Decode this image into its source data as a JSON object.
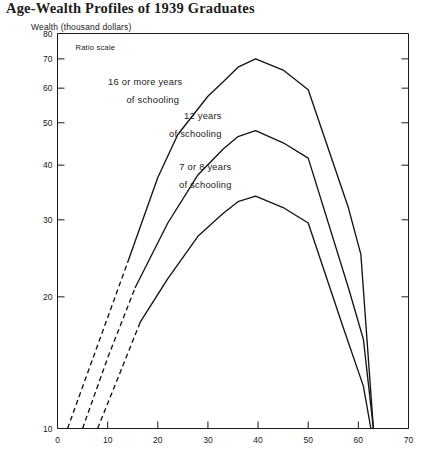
{
  "chart_title": "Age-Wealth Profiles of 1939 Graduates",
  "y_axis_caption": "Wealth (thousand dollars)",
  "scale_note": "Ratio scale",
  "chart_data": {
    "type": "line",
    "title": "Age-Wealth Profiles of 1939 Graduates",
    "subtitle": "",
    "xlabel": "",
    "ylabel": "Wealth (thousand dollars)",
    "scale_note": "Ratio scale",
    "yscale": "log",
    "xscale": "linear",
    "xlim": [
      0,
      70
    ],
    "ylim": [
      10,
      80
    ],
    "xticks": [
      0,
      10,
      20,
      30,
      40,
      50,
      60,
      70
    ],
    "yticks": [
      10,
      20,
      30,
      40,
      50,
      60,
      70,
      80
    ],
    "grid": false,
    "legend": "inline-annotations",
    "series": [
      {
        "name": "16 or more years of schooling",
        "label_line1": "16 or more years",
        "label_line2": "of schooling",
        "dashed_segment": [
          {
            "x": 2.0,
            "y": 10.0
          },
          {
            "x": 8.0,
            "y": 15.5
          },
          {
            "x": 14.0,
            "y": 24.0
          }
        ],
        "solid_segment": [
          {
            "x": 14.0,
            "y": 24.0
          },
          {
            "x": 20.0,
            "y": 37.5
          },
          {
            "x": 24.0,
            "y": 47.0
          },
          {
            "x": 30.0,
            "y": 57.5
          },
          {
            "x": 33.0,
            "y": 62.0
          },
          {
            "x": 36.0,
            "y": 67.0
          },
          {
            "x": 39.5,
            "y": 70.0
          },
          {
            "x": 45.0,
            "y": 66.0
          },
          {
            "x": 50.0,
            "y": 59.5
          },
          {
            "x": 58.0,
            "y": 32.0
          },
          {
            "x": 60.5,
            "y": 25.0
          },
          {
            "x": 63.0,
            "y": 10.0
          }
        ]
      },
      {
        "name": "12 years of schooling",
        "label_line1": "12 years",
        "label_line2": "of schooling",
        "dashed_segment": [
          {
            "x": 5.0,
            "y": 10.0
          },
          {
            "x": 10.0,
            "y": 14.5
          },
          {
            "x": 15.5,
            "y": 21.0
          }
        ],
        "solid_segment": [
          {
            "x": 15.5,
            "y": 21.0
          },
          {
            "x": 22.0,
            "y": 29.5
          },
          {
            "x": 28.0,
            "y": 38.0
          },
          {
            "x": 33.0,
            "y": 43.5
          },
          {
            "x": 36.0,
            "y": 46.5
          },
          {
            "x": 39.5,
            "y": 48.0
          },
          {
            "x": 45.0,
            "y": 45.0
          },
          {
            "x": 50.0,
            "y": 41.5
          },
          {
            "x": 58.0,
            "y": 21.0
          },
          {
            "x": 61.0,
            "y": 16.0
          },
          {
            "x": 63.0,
            "y": 10.0
          }
        ]
      },
      {
        "name": "7 or 8 years of schooling",
        "label_line1": "7 or 8 years",
        "label_line2": "of schooling",
        "dashed_segment": [
          {
            "x": 8.0,
            "y": 10.0
          },
          {
            "x": 12.0,
            "y": 13.0
          },
          {
            "x": 16.5,
            "y": 17.5
          }
        ],
        "solid_segment": [
          {
            "x": 16.5,
            "y": 17.5
          },
          {
            "x": 22.0,
            "y": 22.0
          },
          {
            "x": 28.0,
            "y": 27.5
          },
          {
            "x": 33.0,
            "y": 31.0
          },
          {
            "x": 36.0,
            "y": 33.0
          },
          {
            "x": 39.5,
            "y": 34.0
          },
          {
            "x": 45.0,
            "y": 32.0
          },
          {
            "x": 50.0,
            "y": 29.5
          },
          {
            "x": 57.0,
            "y": 17.0
          },
          {
            "x": 61.0,
            "y": 12.5
          },
          {
            "x": 62.5,
            "y": 10.0
          }
        ]
      }
    ],
    "annotations": [
      {
        "text": "16 or more years",
        "x": 17.5,
        "y": 61.0
      },
      {
        "text": "of schooling",
        "x": 19.0,
        "y": 55.5
      },
      {
        "text": "12 years",
        "x": 29.0,
        "y": 51.0
      },
      {
        "text": "of schooling",
        "x": 27.5,
        "y": 46.5
      },
      {
        "text": "7 or 8 years",
        "x": 29.5,
        "y": 39.0
      },
      {
        "text": "of schooling",
        "x": 29.5,
        "y": 35.5
      }
    ]
  }
}
